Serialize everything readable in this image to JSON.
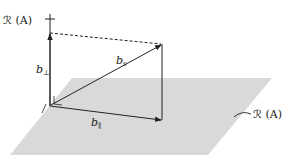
{
  "diagram": {
    "labels": {
      "range_top": "ℛ (A)",
      "range_plane": "ℛ (A)",
      "b_perp": "b",
      "b_perp_sub": "⊥",
      "b_s": "b",
      "b_s_sub": "s",
      "b_par": "b",
      "b_par_sub": "∥"
    },
    "colors": {
      "plane": "#d9d9d9",
      "line": "#222222",
      "background": "#ffffff"
    }
  }
}
